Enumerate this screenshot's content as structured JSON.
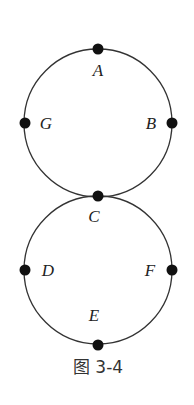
{
  "diagram": {
    "caption": "图 3-4",
    "stroke_color": "#333333",
    "circles": [
      {
        "name": "top-circle",
        "cx": 98,
        "cy": 123,
        "r": 74
      },
      {
        "name": "bottom-circle",
        "cx": 98,
        "cy": 270,
        "r": 74
      }
    ],
    "nodes": [
      {
        "id": "A",
        "x": 98,
        "y": 49,
        "label": "A",
        "lx": 98,
        "ly": 76
      },
      {
        "id": "B",
        "x": 172,
        "y": 123,
        "label": "B",
        "lx": 151,
        "ly": 129
      },
      {
        "id": "G",
        "x": 25,
        "y": 123,
        "label": "G",
        "lx": 46,
        "ly": 129
      },
      {
        "id": "C",
        "x": 98,
        "y": 196,
        "label": "C",
        "lx": 94,
        "ly": 222
      },
      {
        "id": "D",
        "x": 25,
        "y": 270,
        "label": "D",
        "lx": 48,
        "ly": 276
      },
      {
        "id": "F",
        "x": 172,
        "y": 270,
        "label": "F",
        "lx": 150,
        "ly": 276
      },
      {
        "id": "E",
        "x": 98,
        "y": 345,
        "label": "E",
        "lx": 94,
        "ly": 321
      }
    ]
  }
}
